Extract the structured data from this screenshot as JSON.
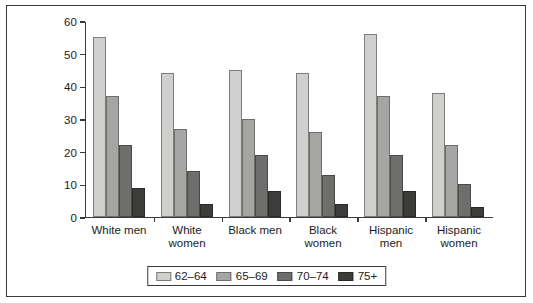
{
  "chart_data": {
    "type": "bar",
    "title": "",
    "subtitle": "",
    "xlabel": "",
    "ylabel": "",
    "ylim": [
      0,
      60
    ],
    "yticks": [
      0,
      10,
      20,
      30,
      40,
      50,
      60
    ],
    "grid": false,
    "legend_position": "bottom",
    "categories": [
      "White men",
      "White\nwomen",
      "Black men",
      "Black\nwomen",
      "Hispanic\nmen",
      "Hispanic\nwomen"
    ],
    "series": [
      {
        "name": "62–64",
        "color": "#cfcfcd",
        "values": [
          55,
          44,
          45,
          44,
          56,
          38
        ]
      },
      {
        "name": "65–69",
        "color": "#a5a5a3",
        "values": [
          37,
          27,
          30,
          26,
          37,
          22
        ]
      },
      {
        "name": "70–74",
        "color": "#6e6e6c",
        "values": [
          22,
          14,
          19,
          13,
          19,
          10
        ]
      },
      {
        "name": "75+",
        "color": "#3c3c3a",
        "values": [
          9,
          4,
          8,
          4,
          8,
          3
        ]
      }
    ]
  },
  "legend": {
    "items": [
      {
        "label": "62–64"
      },
      {
        "label": "65–69"
      },
      {
        "label": "70–74"
      },
      {
        "label": "75+"
      }
    ]
  },
  "axis": {
    "y_tick_labels": [
      "60",
      "50",
      "40",
      "30",
      "20",
      "10",
      "0"
    ]
  }
}
